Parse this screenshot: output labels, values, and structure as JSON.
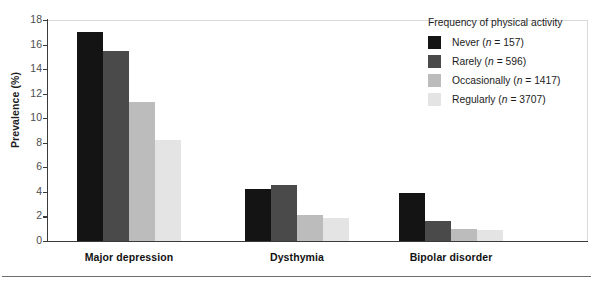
{
  "chart_data": {
    "type": "bar",
    "title": "",
    "xlabel": "",
    "ylabel": "Prevalence (%)",
    "ylim": [
      0,
      18
    ],
    "ytick_step": 2,
    "yticks": [
      0,
      2,
      4,
      6,
      8,
      10,
      12,
      14,
      16,
      18
    ],
    "grid": true,
    "legend_position": "top-right",
    "legend_title": "Frequency of physical activity",
    "categories": [
      "Major depression",
      "Dysthymia",
      "Bipolar disorder"
    ],
    "series": [
      {
        "name": "Never",
        "n": 157,
        "legend_label": "Never (n = 157)",
        "color": "#141414",
        "values": [
          17.0,
          4.2,
          3.9
        ]
      },
      {
        "name": "Rarely",
        "n": 596,
        "legend_label": "Rarely (n = 596)",
        "color": "#4a4a4a",
        "values": [
          15.5,
          4.6,
          1.6
        ]
      },
      {
        "name": "Occasionally",
        "n": 1417,
        "legend_label": "Occasionally (n = 1417)",
        "color": "#bcbcbc",
        "values": [
          11.3,
          2.1,
          1.0
        ]
      },
      {
        "name": "Regularly",
        "n": 3707,
        "legend_label": "Regularly (n = 3707)",
        "color": "#e4e4e4",
        "values": [
          8.2,
          1.9,
          0.9
        ]
      }
    ]
  },
  "legend": {
    "title": "Frequency of physical activity",
    "items": [
      {
        "label_name": "Never",
        "label_n": "(n = 157)",
        "color": "#141414"
      },
      {
        "label_name": "Rarely",
        "label_n": "(n = 596)",
        "color": "#4a4a4a"
      },
      {
        "label_name": "Occasionally",
        "label_n": "(n = 1417)",
        "color": "#bcbcbc"
      },
      {
        "label_name": "Regularly",
        "label_n": "(n = 3707)",
        "color": "#e4e4e4"
      }
    ]
  },
  "axes": {
    "y_title": "Prevalence (%)",
    "y_tick_labels": [
      "0",
      "2",
      "4",
      "6",
      "8",
      "10",
      "12",
      "14",
      "16",
      "18"
    ],
    "x_tick_labels": [
      "Major depression",
      "Dysthymia",
      "Bipolar disorder"
    ]
  }
}
